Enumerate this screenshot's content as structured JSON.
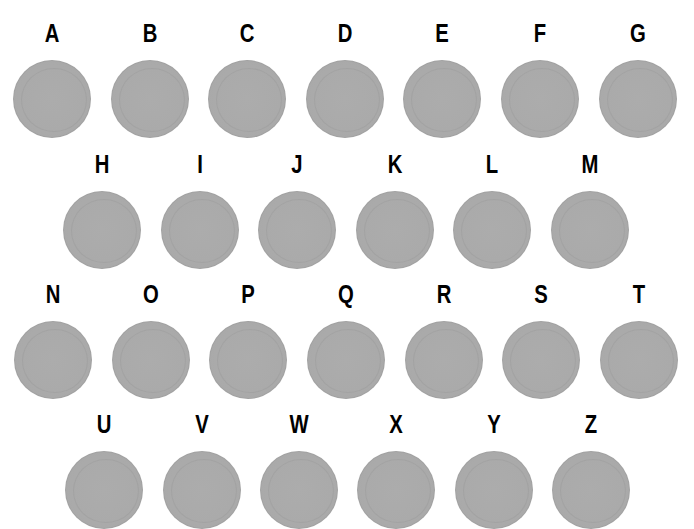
{
  "title": "",
  "circle_color": "#aaaaaa",
  "rows": [
    {
      "label_y": 17,
      "items": [
        {
          "letter": "A",
          "x": 52
        },
        {
          "letter": "B",
          "x": 150
        },
        {
          "letter": "C",
          "x": 247
        },
        {
          "letter": "D",
          "x": 345
        },
        {
          "letter": "E",
          "x": 442
        },
        {
          "letter": "F",
          "x": 540
        },
        {
          "letter": "G",
          "x": 638
        }
      ]
    },
    {
      "label_y": 148,
      "items": [
        {
          "letter": "H",
          "x": 102
        },
        {
          "letter": "I",
          "x": 200
        },
        {
          "letter": "J",
          "x": 297
        },
        {
          "letter": "K",
          "x": 395
        },
        {
          "letter": "L",
          "x": 492
        },
        {
          "letter": "M",
          "x": 590
        }
      ]
    },
    {
      "label_y": 278,
      "items": [
        {
          "letter": "N",
          "x": 53
        },
        {
          "letter": "O",
          "x": 151
        },
        {
          "letter": "P",
          "x": 248
        },
        {
          "letter": "Q",
          "x": 346
        },
        {
          "letter": "R",
          "x": 444
        },
        {
          "letter": "S",
          "x": 541
        },
        {
          "letter": "T",
          "x": 639
        }
      ]
    },
    {
      "label_y": 408,
      "items": [
        {
          "letter": "U",
          "x": 104
        },
        {
          "letter": "V",
          "x": 202
        },
        {
          "letter": "W",
          "x": 299
        },
        {
          "letter": "X",
          "x": 396
        },
        {
          "letter": "Y",
          "x": 494
        },
        {
          "letter": "Z",
          "x": 591
        }
      ]
    }
  ]
}
